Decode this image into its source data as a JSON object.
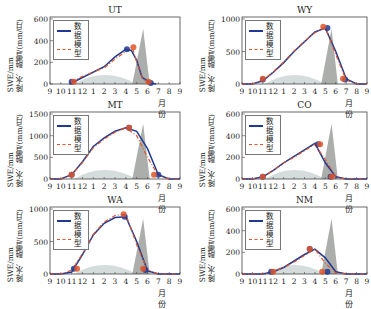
{
  "chart_data": [
    {
      "type": "line",
      "title": "UT",
      "xlabel": "月份",
      "ylabel": "SWE/mm  降水、融雪/(mm/月)",
      "x_ticks": [
        "9",
        "10",
        "11",
        "12",
        "1",
        "2",
        "3",
        "4",
        "5",
        "6",
        "7",
        "8",
        "9"
      ],
      "yticks": [
        0,
        200,
        400,
        600
      ],
      "ylim": [
        0,
        600
      ],
      "legend": [
        "数据",
        "模型"
      ],
      "series": [
        {
          "name": "数据",
          "x": [
            10.8,
            12,
            2,
            3,
            4,
            4.5,
            5,
            5.5,
            6.3,
            6.8
          ],
          "values": [
            0,
            60,
            160,
            250,
            320,
            310,
            220,
            60,
            10,
            0
          ]
        },
        {
          "name": "模型",
          "x": [
            11,
            12,
            2,
            3,
            4,
            4.6,
            5,
            5.5,
            6
          ],
          "values": [
            20,
            70,
            150,
            230,
            300,
            340,
            200,
            60,
            10
          ]
        }
      ],
      "markers": {
        "data": [
          [
            11,
            20
          ],
          [
            4.1,
            320
          ],
          [
            6.3,
            10
          ]
        ],
        "model": [
          [
            11.2,
            20
          ],
          [
            4.7,
            340
          ],
          [
            6.1,
            20
          ]
        ]
      }
    },
    {
      "type": "line",
      "title": "WY",
      "xlabel": "月份",
      "ylabel": "SWE/mm  降水、融雪/(mm/月)",
      "x_ticks": [
        "9",
        "10",
        "11",
        "12",
        "1",
        "2",
        "3",
        "4",
        "5",
        "6",
        "7",
        "8",
        "9"
      ],
      "yticks": [
        0,
        500,
        1000
      ],
      "ylim": [
        0,
        1000
      ],
      "legend": [
        "数据",
        "模型"
      ],
      "series": [
        {
          "name": "数据",
          "values": [
            0,
            0,
            50,
            180,
            330,
            500,
            650,
            800,
            860,
            500,
            80,
            0,
            0
          ]
        },
        {
          "name": "模型",
          "values": [
            0,
            0,
            60,
            190,
            340,
            510,
            660,
            790,
            880,
            450,
            60,
            0,
            0
          ]
        }
      ],
      "markers": {
        "data": [
          [
            11,
            70
          ],
          [
            5.2,
            860
          ],
          [
            6.9,
            70
          ]
        ],
        "model": [
          [
            11,
            80
          ],
          [
            4.8,
            880
          ],
          [
            6.7,
            80
          ]
        ]
      }
    },
    {
      "type": "line",
      "title": "MT",
      "xlabel": "月份",
      "ylabel": "SWE/mm  降水、融雪/(mm/月)",
      "x_ticks": [
        "9",
        "10",
        "11",
        "12",
        "1",
        "2",
        "3",
        "4",
        "5",
        "6",
        "7",
        "8",
        "9"
      ],
      "yticks": [
        0,
        500,
        1000,
        1500
      ],
      "ylim": [
        0,
        1500
      ],
      "legend": [
        "数据",
        "模型"
      ],
      "series": [
        {
          "name": "数据",
          "values": [
            0,
            0,
            100,
            400,
            750,
            950,
            1100,
            1180,
            1100,
            700,
            100,
            0,
            0
          ]
        },
        {
          "name": "模型",
          "values": [
            0,
            0,
            100,
            380,
            720,
            920,
            1080,
            1180,
            1000,
            500,
            80,
            0,
            0
          ]
        }
      ],
      "markers": {
        "data": [
          [
            11,
            100
          ],
          [
            4.3,
            1180
          ],
          [
            7,
            100
          ]
        ],
        "model": [
          [
            11,
            100
          ],
          [
            4.3,
            1180
          ],
          [
            6.6,
            100
          ]
        ]
      }
    },
    {
      "type": "line",
      "title": "CO",
      "xlabel": "月份",
      "ylabel": "SWE/mm  降水、融雪/(mm/月)",
      "x_ticks": [
        "9",
        "10",
        "11",
        "12",
        "1",
        "2",
        "3",
        "4",
        "5",
        "6",
        "7",
        "8",
        "9"
      ],
      "yticks": [
        0,
        200,
        400,
        600
      ],
      "ylim": [
        0,
        600
      ],
      "legend": [
        "数据",
        "模型"
      ],
      "series": [
        {
          "name": "数据",
          "values": [
            0,
            0,
            20,
            80,
            150,
            210,
            270,
            330,
            150,
            20,
            0,
            0,
            0
          ]
        },
        {
          "name": "模型",
          "values": [
            0,
            0,
            20,
            80,
            150,
            200,
            260,
            320,
            180,
            20,
            0,
            0,
            0
          ]
        }
      ],
      "markers": {
        "data": [
          [
            11,
            20
          ],
          [
            4.3,
            320
          ],
          [
            5.5,
            20
          ]
        ],
        "model": [
          [
            11,
            20
          ],
          [
            4.5,
            320
          ],
          [
            5.6,
            20
          ]
        ]
      }
    },
    {
      "type": "line",
      "title": "WA",
      "xlabel": "月份",
      "ylabel": "SWE/mm  降水、融雪/(mm/月)",
      "x_ticks": [
        "9",
        "10",
        "11",
        "12",
        "1",
        "2",
        "3",
        "4",
        "5",
        "6",
        "7",
        "8",
        "9"
      ],
      "yticks": [
        0,
        500,
        1000
      ],
      "ylim": [
        0,
        1000
      ],
      "legend": [
        "数据",
        "模型"
      ],
      "series": [
        {
          "name": "数据",
          "values": [
            0,
            0,
            30,
            300,
            600,
            780,
            870,
            880,
            500,
            50,
            0,
            0,
            0
          ]
        },
        {
          "name": "模型",
          "values": [
            0,
            0,
            60,
            310,
            610,
            800,
            900,
            920,
            450,
            60,
            0,
            0,
            0
          ]
        }
      ],
      "markers": {
        "data": [
          [
            11.2,
            80
          ],
          [
            3.9,
            880
          ],
          [
            5.8,
            60
          ]
        ],
        "model": [
          [
            11.5,
            80
          ],
          [
            3.8,
            920
          ],
          [
            5.6,
            80
          ]
        ]
      }
    },
    {
      "type": "line",
      "title": "NM",
      "xlabel": "月份",
      "ylabel": "SWE/mm  降水、融雪/(mm/月)",
      "x_ticks": [
        "9",
        "10",
        "11",
        "11",
        "12",
        "1",
        "2",
        "3",
        "4",
        "5",
        "6",
        "7",
        "8",
        "9"
      ],
      "yticks": [
        0,
        200,
        400,
        600
      ],
      "ylim": [
        0,
        600
      ],
      "legend": [
        "数据",
        "模型"
      ],
      "series": [
        {
          "name": "数据",
          "values": [
            0,
            0,
            0,
            20,
            60,
            120,
            180,
            230,
            150,
            20,
            0,
            0,
            0
          ]
        },
        {
          "name": "模型",
          "values": [
            0,
            0,
            0,
            20,
            60,
            110,
            170,
            230,
            100,
            10,
            0,
            0,
            0
          ]
        }
      ],
      "markers": {
        "data": [
          [
            11.8,
            20
          ],
          [
            3.5,
            230
          ],
          [
            5.2,
            20
          ]
        ],
        "model": [
          [
            12,
            20
          ],
          [
            3.5,
            230
          ],
          [
            4.7,
            20
          ]
        ]
      }
    }
  ],
  "panels": [
    {
      "title": "UT",
      "y_ticks": [
        "0",
        "200",
        "400",
        "600"
      ],
      "x_ticks": [
        "9",
        "10",
        "11",
        "12",
        "1",
        "2",
        "3",
        "4",
        "5",
        "6",
        "7",
        "8",
        "9"
      ]
    },
    {
      "title": "WY",
      "y_ticks": [
        "0",
        "500",
        "1000"
      ],
      "x_ticks": [
        "9",
        "10",
        "11",
        "12",
        "1",
        "2",
        "3",
        "4",
        "5",
        "6",
        "7",
        "8",
        "9"
      ]
    },
    {
      "title": "MT",
      "y_ticks": [
        "0",
        "500",
        "1000",
        "1500"
      ],
      "x_ticks": [
        "9",
        "10",
        "11",
        "12",
        "1",
        "2",
        "3",
        "4",
        "5",
        "6",
        "7",
        "8",
        "9"
      ]
    },
    {
      "title": "CO",
      "y_ticks": [
        "0",
        "200",
        "400",
        "600"
      ],
      "x_ticks": [
        "9",
        "10",
        "11",
        "12",
        "1",
        "2",
        "3",
        "4",
        "5",
        "6",
        "7",
        "8",
        "9"
      ]
    },
    {
      "title": "WA",
      "y_ticks": [
        "0",
        "500",
        "1000"
      ],
      "x_ticks": [
        "9",
        "10",
        "11",
        "12",
        "1",
        "2",
        "3",
        "4",
        "5",
        "6",
        "7",
        "8",
        "9"
      ]
    },
    {
      "title": "NM",
      "y_ticks": [
        "0",
        "200",
        "400",
        "600"
      ],
      "x_ticks": [
        "9",
        "10",
        "11",
        "12",
        "1",
        "2",
        "3",
        "4",
        "5",
        "6",
        "7",
        "8",
        "9"
      ]
    }
  ],
  "labels": {
    "ylabel": "SWE/mm",
    "ylabel2": "降水、融雪/(mm/月)",
    "xlabel": "月份",
    "legend_data": "数据",
    "legend_model": "模型"
  },
  "colors": {
    "data": "#1f3a93",
    "model": "#e0552a",
    "precip": "#c9d3d3",
    "melt": "#8f938f"
  }
}
